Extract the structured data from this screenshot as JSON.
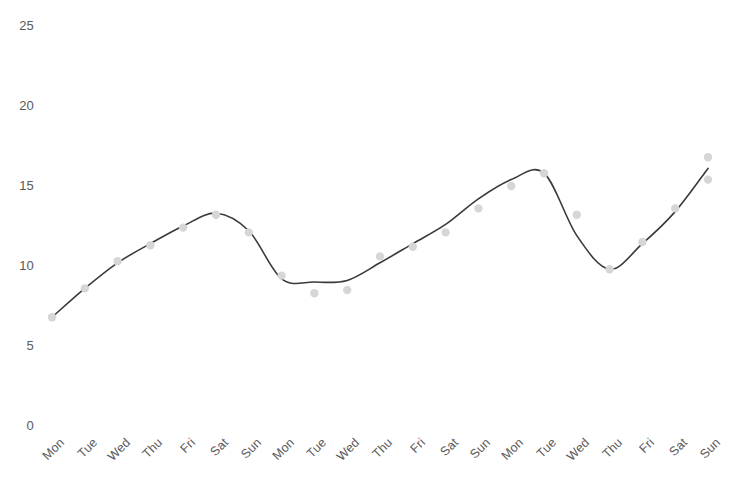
{
  "chart_data": {
    "type": "line",
    "title": "",
    "subtitle": "",
    "xlabel": "",
    "ylabel": "",
    "grid": false,
    "legend": false,
    "legend_position": "none",
    "xlim": [
      0,
      20
    ],
    "ylim": [
      0,
      25
    ],
    "yticks": [
      0,
      5,
      10,
      15,
      20,
      25
    ],
    "ytick_labels": [
      "0",
      "5",
      "10",
      "15",
      "20",
      "25"
    ],
    "categories": [
      "Mon",
      "Tue",
      "Wed",
      "Thu",
      "Fri",
      "Sat",
      "Sun",
      "Mon",
      "Tue",
      "Wed",
      "Thu",
      "Fri",
      "Sat",
      "Sun",
      "Mon",
      "Tue",
      "Wed",
      "Thu",
      "Fri",
      "Sat",
      "Sun"
    ],
    "series": [
      {
        "name": "observed",
        "kind": "scatter",
        "marker_color": "#d6d6d6",
        "values": [
          6.8,
          8.6,
          10.3,
          11.3,
          12.4,
          13.2,
          12.1,
          9.4,
          8.3,
          8.5,
          10.6,
          11.2,
          12.1,
          13.6,
          15.0,
          15.8,
          13.2,
          9.8,
          11.5,
          13.6,
          16.8
        ]
      },
      {
        "name": "fitted",
        "kind": "line",
        "line_color": "#3a3a3a",
        "values": [
          6.8,
          8.6,
          10.2,
          11.4,
          12.5,
          13.3,
          12.2,
          9.2,
          9.0,
          9.1,
          10.2,
          11.4,
          12.6,
          14.2,
          15.4,
          15.8,
          11.9,
          9.8,
          11.4,
          13.4,
          16.1
        ]
      }
    ],
    "extra_points": [
      {
        "x_index": 20,
        "value": 15.4
      }
    ],
    "axis_color": "#595959",
    "background_color": "#ffffff"
  },
  "axes": {
    "y_labels": [
      "25",
      "20",
      "15",
      "10",
      "5",
      "0"
    ],
    "x_labels": [
      "Mon",
      "Tue",
      "Wed",
      "Thu",
      "Fri",
      "Sat",
      "Sun",
      "Mon",
      "Tue",
      "Wed",
      "Thu",
      "Fri",
      "Sat",
      "Sun",
      "Mon",
      "Tue",
      "Wed",
      "Thu",
      "Fri",
      "Sat",
      "Sun"
    ]
  }
}
